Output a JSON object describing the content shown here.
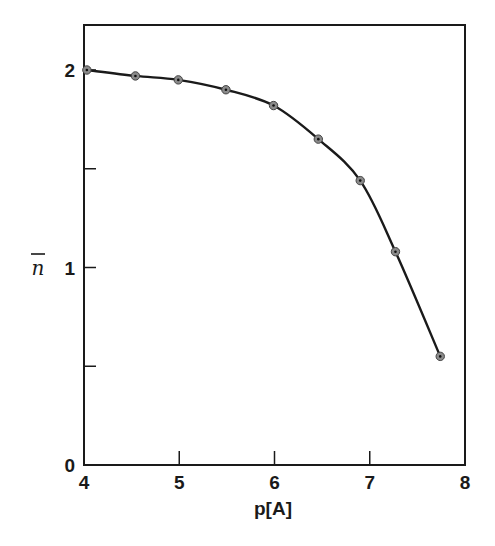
{
  "chart_data": {
    "type": "line",
    "title": "",
    "xlabel": "p[A]",
    "ylabel": "n̄",
    "xlim": [
      4,
      8
    ],
    "ylim": [
      0,
      2.23
    ],
    "x_ticks": [
      4,
      5,
      6,
      7,
      8
    ],
    "x_tick_labels": [
      "4",
      "5",
      "6",
      "7",
      "8"
    ],
    "y_ticks": [
      0,
      0.5,
      1,
      1.5,
      2
    ],
    "y_tick_labels": [
      "0",
      "",
      "1",
      "",
      "2"
    ],
    "grid": false,
    "legend": null,
    "series": [
      {
        "name": "n̄ vs p",
        "markers": "circle",
        "x": [
          4.03,
          4.54,
          4.99,
          5.49,
          5.99,
          6.46,
          6.9,
          7.27,
          7.74
        ],
        "y": [
          2.0,
          1.97,
          1.95,
          1.9,
          1.82,
          1.65,
          1.44,
          1.08,
          0.55
        ]
      }
    ]
  },
  "labels": {
    "x_axis": "p[A]",
    "y_axis": "n"
  }
}
